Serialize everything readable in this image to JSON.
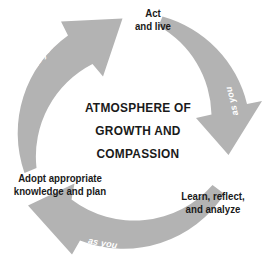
{
  "diagram": {
    "type": "cycle",
    "title_lines": [
      "ATMOSPHERE OF",
      "GROWTH AND",
      "COMPASSION"
    ],
    "arrow_color": "#b3b3b3",
    "text_color": "#1a1a1a",
    "motion_text_color": "#ffffff",
    "background_color": "#ffffff",
    "stages": [
      {
        "id": "act",
        "lines": [
          "Act",
          "and live"
        ]
      },
      {
        "id": "learn",
        "lines": [
          "Learn, reflect,",
          "and analyze"
        ]
      },
      {
        "id": "adopt",
        "lines": [
          "Adopt appropriate",
          "knowledge and plan"
        ]
      }
    ],
    "arcs": [
      {
        "id": "arc-top-right",
        "motion_text": "as you",
        "direction": "clockwise"
      },
      {
        "id": "arc-bottom-left",
        "motion_text": "as you",
        "direction": "clockwise"
      },
      {
        "id": "arc-left-top",
        "motion_text": "as you",
        "direction": "clockwise"
      }
    ]
  }
}
